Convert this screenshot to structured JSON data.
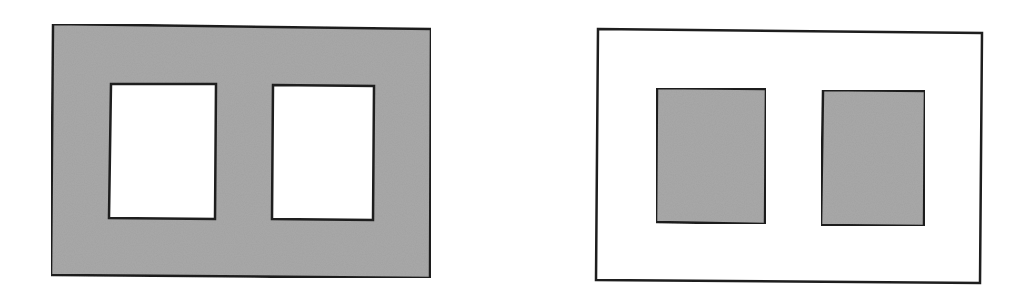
{
  "figure": {
    "colors": {
      "fill_gray": "#a9a9a9",
      "stroke": "#1e1e1e",
      "background": "#ffffff"
    },
    "panels": [
      {
        "id": "left",
        "outer": {
          "x1": 52,
          "y1": 24,
          "x2": 431,
          "y2": 278,
          "fill": "gray"
        },
        "inner": [
          {
            "x1": 110,
            "y1": 84,
            "x2": 215,
            "y2": 218,
            "fill": "white"
          },
          {
            "x1": 273,
            "y1": 85,
            "x2": 373,
            "y2": 220,
            "fill": "white"
          }
        ]
      },
      {
        "id": "right",
        "outer": {
          "x1": 597,
          "y1": 29,
          "x2": 982,
          "y2": 283,
          "fill": "white"
        },
        "inner": [
          {
            "x1": 656,
            "y1": 89,
            "x2": 765,
            "y2": 223,
            "fill": "gray"
          },
          {
            "x1": 822,
            "y1": 90,
            "x2": 924,
            "y2": 225,
            "fill": "gray"
          }
        ]
      }
    ]
  }
}
